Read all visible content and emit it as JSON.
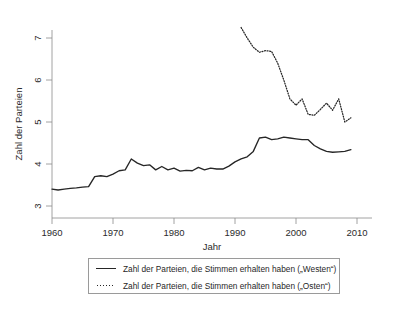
{
  "chart_data": {
    "type": "line",
    "title": "",
    "xlabel": "Jahr",
    "ylabel": "Zahl der Parteien",
    "xlim": [
      1958,
      2011
    ],
    "ylim": [
      2.75,
      7.45
    ],
    "xticks": [
      1960,
      1970,
      1980,
      1990,
      2000,
      2010
    ],
    "xticklabels": [
      "1960",
      "1970",
      "1980",
      "1990",
      "2000",
      "2010"
    ],
    "yticks": [
      3,
      4,
      5,
      6,
      7
    ],
    "yticklabels": [
      "3",
      "4",
      "5",
      "6",
      "7"
    ],
    "grid": false,
    "legend_position": "below-plot",
    "series": [
      {
        "name": "Zahl der Parteien, die Stimmen erhalten haben („Westen“)",
        "style": "solid",
        "color": "#262626",
        "x": [
          1960,
          1961,
          1962,
          1963,
          1964,
          1965,
          1966,
          1967,
          1968,
          1969,
          1970,
          1971,
          1972,
          1973,
          1974,
          1975,
          1976,
          1977,
          1978,
          1979,
          1980,
          1981,
          1982,
          1983,
          1984,
          1985,
          1986,
          1987,
          1988,
          1989,
          1990,
          1991,
          1992,
          1993,
          1994,
          1995,
          1996,
          1997,
          1998,
          1999,
          2000,
          2001,
          2002,
          2003,
          2004,
          2005,
          2006,
          2007,
          2008,
          2009
        ],
        "values": [
          3.4,
          3.38,
          3.4,
          3.42,
          3.43,
          3.45,
          3.46,
          3.7,
          3.72,
          3.7,
          3.76,
          3.84,
          3.86,
          4.12,
          4.02,
          3.96,
          3.98,
          3.86,
          3.94,
          3.86,
          3.9,
          3.83,
          3.85,
          3.84,
          3.92,
          3.86,
          3.9,
          3.88,
          3.88,
          3.95,
          4.05,
          4.12,
          4.17,
          4.3,
          4.62,
          4.64,
          4.58,
          4.6,
          4.64,
          4.62,
          4.6,
          4.58,
          4.58,
          4.44,
          4.36,
          4.3,
          4.28,
          4.29,
          4.3,
          4.34
        ]
      },
      {
        "name": "Zahl der Parteien, die Stimmen erhalten haben („Osten“)",
        "style": "dotted",
        "color": "#262626",
        "x": [
          1991,
          1992,
          1993,
          1994,
          1995,
          1996,
          1997,
          1998,
          1999,
          2000,
          2001,
          2002,
          2003,
          2004,
          2005,
          2006,
          2007,
          2008,
          2009
        ],
        "values": [
          7.25,
          7.0,
          6.78,
          6.66,
          6.7,
          6.68,
          6.4,
          6.0,
          5.55,
          5.4,
          5.55,
          5.18,
          5.16,
          5.3,
          5.45,
          5.28,
          5.55,
          5.0,
          5.1
        ]
      }
    ]
  },
  "legend": {
    "items": [
      {
        "label": "Zahl der Parteien, die Stimmen erhalten haben („Westen“)",
        "key": "solid-line-key"
      },
      {
        "label": "Zahl der Parteien, die Stimmen erhalten haben („Osten“)",
        "key": "dotted-line-key"
      }
    ]
  }
}
